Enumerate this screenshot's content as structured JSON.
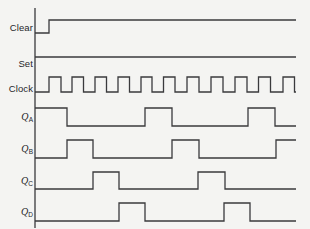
{
  "figure": {
    "kind": "digital-timing-diagram",
    "background_color": "#f4f4f2",
    "line_color": "#3a3a3c",
    "line_width": 1.3
  },
  "axis": {
    "x": 35,
    "y_top": 8,
    "y_bottom": 228,
    "x_start": 35,
    "x_end": 296
  },
  "chart_data": {
    "type": "line",
    "title": "",
    "xlabel": "",
    "ylabel": "",
    "legend_position": "left",
    "series": [
      {
        "name": "Clear",
        "initial_level": 0,
        "transition_x": [
          49
        ]
      },
      {
        "name": "Set",
        "initial_level": 1,
        "transition_x": []
      },
      {
        "name": "Clock",
        "initial_level": 0,
        "transition_x": [
          49,
          61,
          72,
          83.5,
          95,
          106.5,
          118,
          129.5,
          141,
          152,
          163.5,
          175,
          187,
          199,
          211,
          223,
          235,
          247,
          258.5,
          270.5,
          283,
          294.5
        ]
      },
      {
        "name": "QA",
        "initial_level": 1,
        "transition_x": [
          67,
          145,
          172,
          248,
          275
        ]
      },
      {
        "name": "QB",
        "initial_level": 0,
        "transition_x": [
          67,
          93,
          172,
          199,
          276
        ]
      },
      {
        "name": "QC",
        "initial_level": 0,
        "transition_x": [
          93,
          119,
          198,
          225
        ]
      },
      {
        "name": "QD",
        "initial_level": 0,
        "transition_x": [
          119,
          145,
          224,
          250
        ]
      }
    ]
  },
  "signals": [
    {
      "id": "clear",
      "label": "Clear",
      "sub": "",
      "initial": 0,
      "transitions": [
        49
      ],
      "y_high": 20,
      "y_low": 33,
      "label_y": 28
    },
    {
      "id": "set",
      "label": "Set",
      "sub": "",
      "initial": 1,
      "transitions": [],
      "y_high": 57,
      "y_low": 70,
      "label_y": 64
    },
    {
      "id": "clock",
      "label": "Clock",
      "sub": "",
      "initial": 0,
      "transitions": [
        49,
        61,
        72,
        83.5,
        95,
        106.5,
        118,
        129.5,
        141,
        152,
        163.5,
        175,
        187,
        199,
        211,
        223,
        235,
        247,
        258.5,
        270.5,
        283,
        294.5
      ],
      "y_high": 77,
      "y_low": 92,
      "label_y": 89
    },
    {
      "id": "qa",
      "label": "Q",
      "sub": "A",
      "initial": 1,
      "transitions": [
        67,
        145,
        172,
        248,
        275
      ],
      "y_high": 108,
      "y_low": 126,
      "label_y": 117
    },
    {
      "id": "qb",
      "label": "Q",
      "sub": "B",
      "initial": 0,
      "transitions": [
        67,
        93,
        172,
        199,
        276
      ],
      "y_high": 140,
      "y_low": 158,
      "label_y": 149
    },
    {
      "id": "qc",
      "label": "Q",
      "sub": "C",
      "initial": 0,
      "transitions": [
        93,
        119,
        198,
        225
      ],
      "y_high": 172,
      "y_low": 189,
      "label_y": 181
    },
    {
      "id": "qd",
      "label": "Q",
      "sub": "D",
      "initial": 0,
      "transitions": [
        119,
        145,
        224,
        250
      ],
      "y_high": 203,
      "y_low": 221,
      "label_y": 212
    }
  ]
}
